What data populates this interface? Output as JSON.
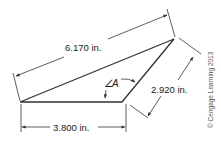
{
  "diagram": {
    "type": "triangle-dimensioned",
    "colors": {
      "stroke": "#333333",
      "text": "#222222",
      "background": "#ffffff"
    },
    "dimensions": {
      "long_side": "6.170 in.",
      "bottom_side": "3.800 in.",
      "right_side": "2.920 in."
    },
    "angle_label": "A",
    "copyright": "© Cengage Learning 2013"
  }
}
